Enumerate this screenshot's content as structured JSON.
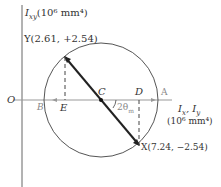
{
  "diagram": {
    "type": "mohr-circle",
    "y_axis_label": "I",
    "y_axis_sub": "xy",
    "y_axis_units": "(10⁶ mm⁴)",
    "x_axis_label": "I",
    "x_axis_sub1": "x",
    "x_axis_sep": ", I",
    "x_axis_sub2": "y",
    "x_axis_units": "(10⁶ mm⁴)",
    "origin_label": "O",
    "point_y": "Y(2.61, +2.54)",
    "point_x": "X(7.24, −2.54)",
    "center_label": "C",
    "point_a": "A",
    "point_b": "B",
    "point_d": "D",
    "point_e": "E",
    "angle_label": "2θ",
    "angle_sub": "m"
  }
}
